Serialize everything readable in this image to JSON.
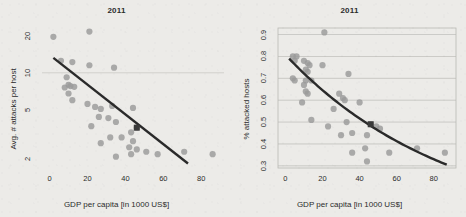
{
  "figure": {
    "background_color": "#ecebe8",
    "point_color": "#9a9a9a",
    "line_color": "#2a2a2a",
    "grid_color": "#b9b9b4",
    "highlight_color": "#3a3a3a"
  },
  "panels": [
    {
      "id": "left",
      "title": "2011",
      "chart_data": {
        "type": "scatter",
        "title": "2011",
        "xlabel": "GDP per capita [in 1000 US$]",
        "ylabel": "Avg. # attacks per host",
        "xlim": [
          -4,
          92
        ],
        "ylim": [
          1.7,
          23
        ],
        "yscale": "log",
        "xscale": "linear",
        "xticks": [
          0,
          20,
          40,
          60,
          80
        ],
        "yticks": [
          2,
          5,
          10,
          20
        ],
        "grid": "horizontal-faint",
        "legend": "none",
        "points": [
          {
            "x": 2,
            "y": 19.5
          },
          {
            "x": 21,
            "y": 21.5
          },
          {
            "x": 6,
            "y": 12.5
          },
          {
            "x": 12,
            "y": 12.2
          },
          {
            "x": 21,
            "y": 11.5
          },
          {
            "x": 34,
            "y": 11.0
          },
          {
            "x": 9,
            "y": 9.2
          },
          {
            "x": 10,
            "y": 8.0
          },
          {
            "x": 11,
            "y": 7.8
          },
          {
            "x": 13,
            "y": 7.7
          },
          {
            "x": 8,
            "y": 7.6
          },
          {
            "x": 10,
            "y": 6.8
          },
          {
            "x": 12,
            "y": 6.0
          },
          {
            "x": 20,
            "y": 5.6
          },
          {
            "x": 24,
            "y": 5.3
          },
          {
            "x": 27,
            "y": 5.1
          },
          {
            "x": 33,
            "y": 5.4
          },
          {
            "x": 44,
            "y": 5.2
          },
          {
            "x": 26,
            "y": 4.4
          },
          {
            "x": 31,
            "y": 4.3
          },
          {
            "x": 35,
            "y": 4.0
          },
          {
            "x": 22,
            "y": 3.7
          },
          {
            "x": 46,
            "y": 3.6
          },
          {
            "x": 43,
            "y": 3.3
          },
          {
            "x": 32,
            "y": 3.0
          },
          {
            "x": 38,
            "y": 3.0
          },
          {
            "x": 44,
            "y": 2.8
          },
          {
            "x": 27,
            "y": 2.7
          },
          {
            "x": 42,
            "y": 2.5
          },
          {
            "x": 46,
            "y": 2.4
          },
          {
            "x": 51,
            "y": 2.3
          },
          {
            "x": 35,
            "y": 2.1
          },
          {
            "x": 43,
            "y": 2.2
          },
          {
            "x": 57,
            "y": 2.2
          },
          {
            "x": 71,
            "y": 2.3
          },
          {
            "x": 86,
            "y": 2.2
          }
        ],
        "highlight_point": {
          "x": 46,
          "y": 3.6
        },
        "trend": {
          "type": "loglinear",
          "x0": 2,
          "y0": 13.2,
          "x1": 73,
          "y1": 1.85
        }
      }
    },
    {
      "id": "right",
      "title": "2011",
      "chart_data": {
        "type": "scatter",
        "title": "2011",
        "xlabel": "GDP per capita [in 1000 US$]",
        "ylabel": "% attacked hosts",
        "xlim": [
          -4,
          92
        ],
        "ylim": [
          0.29,
          0.93
        ],
        "yscale": "linear",
        "xscale": "linear",
        "xticks": [
          0,
          20,
          40,
          60,
          80
        ],
        "yticks": [
          0.3,
          0.4,
          0.5,
          0.6,
          0.7,
          0.8,
          0.9
        ],
        "grid": "horizontal",
        "legend": "none",
        "points": [
          {
            "x": 21,
            "y": 0.91
          },
          {
            "x": 4,
            "y": 0.8
          },
          {
            "x": 6,
            "y": 0.8
          },
          {
            "x": 5,
            "y": 0.78
          },
          {
            "x": 10,
            "y": 0.78
          },
          {
            "x": 12,
            "y": 0.77
          },
          {
            "x": 13,
            "y": 0.76
          },
          {
            "x": 20,
            "y": 0.76
          },
          {
            "x": 11,
            "y": 0.74
          },
          {
            "x": 12,
            "y": 0.73
          },
          {
            "x": 4,
            "y": 0.7
          },
          {
            "x": 5,
            "y": 0.69
          },
          {
            "x": 11,
            "y": 0.69
          },
          {
            "x": 14,
            "y": 0.69
          },
          {
            "x": 34,
            "y": 0.72
          },
          {
            "x": 10,
            "y": 0.67
          },
          {
            "x": 11,
            "y": 0.64
          },
          {
            "x": 12,
            "y": 0.63
          },
          {
            "x": 29,
            "y": 0.63
          },
          {
            "x": 31,
            "y": 0.61
          },
          {
            "x": 32,
            "y": 0.6
          },
          {
            "x": 40,
            "y": 0.59
          },
          {
            "x": 9,
            "y": 0.59
          },
          {
            "x": 26,
            "y": 0.56
          },
          {
            "x": 14,
            "y": 0.51
          },
          {
            "x": 33,
            "y": 0.5
          },
          {
            "x": 23,
            "y": 0.48
          },
          {
            "x": 46,
            "y": 0.49
          },
          {
            "x": 49,
            "y": 0.48
          },
          {
            "x": 51,
            "y": 0.47
          },
          {
            "x": 30,
            "y": 0.44
          },
          {
            "x": 36,
            "y": 0.45
          },
          {
            "x": 44,
            "y": 0.44
          },
          {
            "x": 43,
            "y": 0.38
          },
          {
            "x": 71,
            "y": 0.38
          },
          {
            "x": 36,
            "y": 0.36
          },
          {
            "x": 56,
            "y": 0.36
          },
          {
            "x": 86,
            "y": 0.36
          },
          {
            "x": 44,
            "y": 0.32
          }
        ],
        "highlight_point": {
          "x": 46,
          "y": 0.49
        },
        "trend": {
          "type": "exponential-decay",
          "x0": 2,
          "y0": 0.79,
          "x1": 87,
          "y1": 0.305
        }
      }
    }
  ]
}
